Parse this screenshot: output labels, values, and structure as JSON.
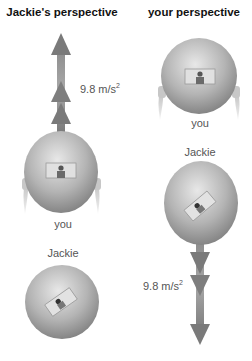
{
  "left_panel": {
    "title": "Jackie's perspective",
    "acceleration": {
      "value": "9.8 m/s",
      "exponent": "2",
      "direction": "up"
    },
    "top_label": "you",
    "bottom_label": "Jackie"
  },
  "right_panel": {
    "title": "your perspective",
    "acceleration": {
      "value": "9.8 m/s",
      "exponent": "2",
      "direction": "down"
    },
    "top_label": "you",
    "bottom_label": "Jackie"
  },
  "colors": {
    "arrow": "#7a7a7a",
    "sphere_light": "#e6e6e6",
    "sphere_dark": "#8a8a8a",
    "text": "#555555",
    "title": "#111111"
  }
}
